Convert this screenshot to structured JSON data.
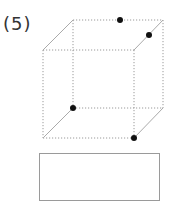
{
  "problem": {
    "number_label": "(5)"
  },
  "cube": {
    "edge_style": "dotted",
    "edge_color": "#9a9a9a",
    "dot_color": "#111111",
    "vertices": {
      "front_top_left": [
        43,
        50
      ],
      "front_top_right": [
        134,
        50
      ],
      "front_bottom_left": [
        43,
        138
      ],
      "front_bottom_right": [
        134,
        138
      ],
      "back_top_left": [
        73,
        20
      ],
      "back_top_right": [
        163,
        20
      ],
      "back_bottom_left": [
        73,
        108
      ],
      "back_bottom_right": [
        163,
        108
      ]
    },
    "points": [
      {
        "name": "midpoint-back-top-edge",
        "x": 120,
        "y": 20
      },
      {
        "name": "point-on-right-top-slant-edge",
        "x": 149,
        "y": 35
      },
      {
        "name": "back-bottom-left-vertex",
        "x": 73,
        "y": 108
      },
      {
        "name": "front-bottom-right-vertex",
        "x": 134,
        "y": 138
      }
    ]
  },
  "answer_box": {
    "value": ""
  }
}
